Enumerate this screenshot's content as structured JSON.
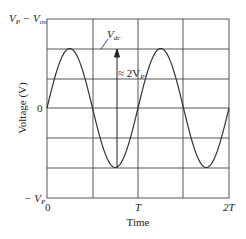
{
  "chart_data": {
    "type": "line",
    "title": "",
    "xlabel": "Time",
    "ylabel": "Voltage (V)",
    "x_ticks": [
      "0",
      "T",
      "2T"
    ],
    "y_ticks": [
      "−V_P",
      "0",
      "V_P − V_on"
    ],
    "series": [
      {
        "name": "input sine",
        "description": "sinusoid amplitude V_P, two periods over 0..2T, peaks at T/4 and 5T/4, troughs at 3T/4 and 7T/4",
        "x": [
          0,
          0.25,
          0.5,
          0.75,
          1.0,
          1.25,
          1.5,
          1.75,
          2.0
        ],
        "y": [
          0,
          1,
          0,
          -1,
          0,
          1,
          0,
          -1,
          0
        ]
      }
    ],
    "annotations": [
      {
        "text": "V_dc",
        "points_to": "peak level line"
      },
      {
        "text": "≈ 2V_P",
        "arrow": "vertical arrow from trough up to peak level at t≈0.75T"
      }
    ],
    "grid": true,
    "xlim": [
      0,
      2
    ],
    "ylim": [
      -1.5,
      1.5
    ]
  },
  "labels": {
    "y_top": "V",
    "y_top_sub_p": "P",
    "y_top_minus": " − V",
    "y_top_sub_on": "on",
    "vdc": "V",
    "vdc_sub": "dc",
    "approx": "≈ 2V",
    "approx_sub": "P",
    "zero_y": "0",
    "neg_vp": "− V",
    "neg_vp_sub": "P",
    "x0": "0",
    "xT": "T",
    "x2T": "2T",
    "xlabel": "Time",
    "ylabel": "Voltage (V)"
  }
}
